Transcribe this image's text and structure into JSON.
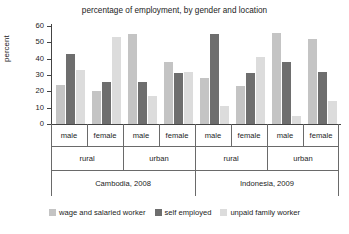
{
  "chart_data": {
    "type": "bar",
    "title": "percentage of employment, by gender and location",
    "xlabel": "",
    "ylabel": "percent",
    "ylim": [
      0,
      60
    ],
    "yticks": [
      0,
      10,
      20,
      30,
      40,
      50,
      60
    ],
    "grid": false,
    "legend_position": "bottom",
    "categories": [
      "Cambodia, 2008 / rural / male",
      "Cambodia, 2008 / rural / female",
      "Cambodia, 2008 / urban / male",
      "Cambodia, 2008 / urban / female",
      "Indonesia, 2009 / rural / male",
      "Indonesia, 2009 / rural / female",
      "Indonesia, 2009 / urban / male",
      "Indonesia, 2009 / urban / female"
    ],
    "series": [
      {
        "name": "wage and salaried worker",
        "color": "#c4c4c4",
        "values": [
          24,
          20,
          55,
          38,
          28,
          23,
          56,
          52
        ]
      },
      {
        "name": "self employed",
        "color": "#6e6e6e",
        "values": [
          43,
          26,
          26,
          31,
          55,
          31,
          38,
          32
        ]
      },
      {
        "name": "unpaid family worker",
        "color": "#dcdcdc",
        "values": [
          33,
          53,
          17,
          32,
          11,
          41,
          5,
          14
        ]
      }
    ],
    "groups": {
      "gender": [
        "male",
        "female",
        "male",
        "female",
        "male",
        "female",
        "male",
        "female"
      ],
      "location": [
        "rural",
        "urban",
        "rural",
        "urban"
      ],
      "country": [
        "Cambodia, 2008",
        "Indonesia, 2009"
      ]
    }
  }
}
